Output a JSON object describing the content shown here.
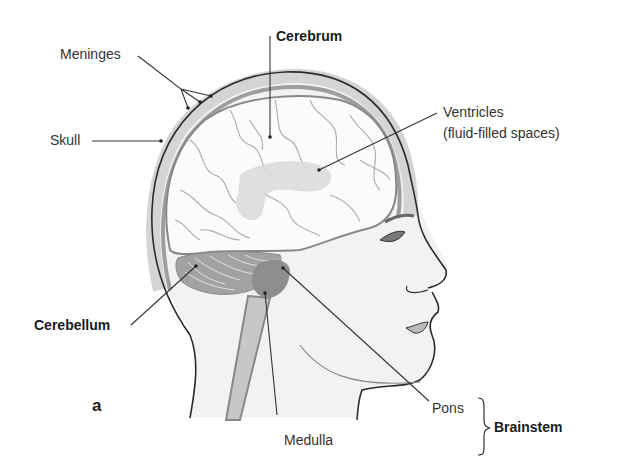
{
  "diagram": {
    "panel_letter": "a",
    "labels": {
      "meninges": "Meninges",
      "skull": "Skull",
      "cerebrum": "Cerebrum",
      "ventricles_line1": "Ventricles",
      "ventricles_line2": "(fluid-filled spaces)",
      "cerebellum": "Cerebellum",
      "pons": "Pons",
      "medulla": "Medulla",
      "brainstem": "Brainstem"
    },
    "groups": [
      {
        "name": "Brainstem",
        "members": [
          "Pons",
          "Medulla"
        ]
      }
    ],
    "colors": {
      "outline": "#2b2b2b",
      "skin": "#f1f1f1",
      "skull_band": "#d6d6d6",
      "meninges_band": "#9a9a9a",
      "brain": "#fbfbfb",
      "gyri_lines": "#a8a8a8",
      "ventricles": "#dcdcdc",
      "cerebellum": "#9d9d9d",
      "brainstem": "#8c8c8c",
      "leader_lines": "#333333"
    }
  }
}
